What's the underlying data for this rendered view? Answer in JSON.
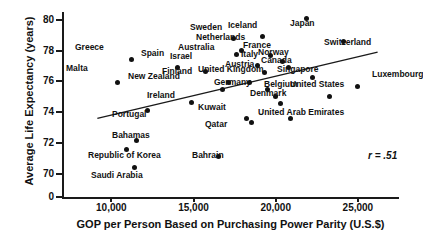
{
  "chart_data": {
    "type": "scatter",
    "title": "",
    "xlabel": "GOP per Person Based on Purchasing Power Parity (U.S.$)",
    "ylabel": "Average Life Expectancy (years)",
    "xlim": [
      7000,
      27500
    ],
    "ylim": [
      68.5,
      80.5
    ],
    "xticks": [
      "10,000",
      "15,000",
      "20,000",
      "25,000"
    ],
    "xtick_values": [
      10000,
      15000,
      20000,
      25000
    ],
    "yticks": [
      "0",
      "70",
      "72",
      "74",
      "76",
      "78",
      "80"
    ],
    "ytick_values": [
      68.5,
      70,
      72,
      74,
      76,
      78,
      80
    ],
    "grid": false,
    "legend": false,
    "annotation": "r = .51",
    "correlation": 0.51,
    "trendline": {
      "x0": 9150,
      "y0": 73.6,
      "x1": 26200,
      "y1": 77.9
    },
    "points": [
      {
        "label": "Greece",
        "x": 11250,
        "y": 77.45,
        "lx": 75,
        "ly": 43
      },
      {
        "label": "Malta",
        "x": 10400,
        "y": 75.9,
        "lx": 66,
        "ly": 64
      },
      {
        "label": "Spain",
        "x": 14000,
        "y": 76.9,
        "lx": 141,
        "ly": 49
      },
      {
        "label": "Israel",
        "x": 15750,
        "y": 76.65,
        "lx": 170,
        "ly": 52
      },
      {
        "label": "Sweden",
        "x": 17450,
        "y": 78.75,
        "lx": 190,
        "ly": 23
      },
      {
        "label": "Iceland",
        "x": 19200,
        "y": 78.9,
        "lx": 228,
        "ly": 21
      },
      {
        "label": "Japan",
        "x": 21900,
        "y": 80.05,
        "lx": 290,
        "ly": 19
      },
      {
        "label": "Switzerland",
        "x": 24100,
        "y": 78.6,
        "lx": 324,
        "ly": 38
      },
      {
        "label": "Netherlands",
        "x": 17900,
        "y": 78.0,
        "lx": 196,
        "ly": 33
      },
      {
        "label": "Australia",
        "x": 17600,
        "y": 77.75,
        "lx": 178,
        "ly": 43
      },
      {
        "label": "Italy",
        "x": 18900,
        "y": 77.0,
        "lx": 241,
        "ly": 50
      },
      {
        "label": "France",
        "x": 19700,
        "y": 77.65,
        "lx": 243,
        "ly": 41
      },
      {
        "label": "Norway",
        "x": 20400,
        "y": 77.3,
        "lx": 258,
        "ly": 48
      },
      {
        "label": "Canada",
        "x": 20800,
        "y": 76.9,
        "lx": 261,
        "ly": 56
      },
      {
        "label": "Austria",
        "x": 19300,
        "y": 76.55,
        "lx": 225,
        "ly": 60
      },
      {
        "label": "Finland",
        "x": 17100,
        "y": 75.9,
        "lx": 162,
        "ly": 67
      },
      {
        "label": "United Kingdom",
        "x": 18400,
        "y": 75.9,
        "lx": 198,
        "ly": 65
      },
      {
        "label": "Germany",
        "x": 19500,
        "y": 75.5,
        "lx": 214,
        "ly": 78
      },
      {
        "label": "Singapore",
        "x": 22250,
        "y": 76.25,
        "lx": 277,
        "ly": 65
      },
      {
        "label": "New Zealand",
        "x": 16750,
        "y": 75.5,
        "lx": 128,
        "ly": 72
      },
      {
        "label": "Belgium",
        "x": 20000,
        "y": 75.0,
        "lx": 264,
        "ly": 80
      },
      {
        "label": "Denmark",
        "x": 20300,
        "y": 74.55,
        "lx": 250,
        "ly": 89
      },
      {
        "label": "United States",
        "x": 23300,
        "y": 75.0,
        "lx": 290,
        "ly": 80
      },
      {
        "label": "Luxembourg",
        "x": 25000,
        "y": 75.65,
        "lx": 372,
        "ly": 70
      },
      {
        "label": "Ireland",
        "x": 14900,
        "y": 74.6,
        "lx": 147,
        "ly": 91
      },
      {
        "label": "Portugal",
        "x": 12200,
        "y": 74.1,
        "lx": 112,
        "ly": 110
      },
      {
        "label": "Kuwait",
        "x": 18200,
        "y": 73.6,
        "lx": 198,
        "ly": 103
      },
      {
        "label": "Qatar",
        "x": 18500,
        "y": 73.35,
        "lx": 205,
        "ly": 120
      },
      {
        "label": "United Arab Emirates",
        "x": 20900,
        "y": 73.6,
        "lx": 258,
        "ly": 108
      },
      {
        "label": "Bahamas",
        "x": 11550,
        "y": 72.15,
        "lx": 112,
        "ly": 131
      },
      {
        "label": "Republic of Korea",
        "x": 10950,
        "y": 71.6,
        "lx": 88,
        "ly": 151
      },
      {
        "label": "Bahrain",
        "x": 16550,
        "y": 71.1,
        "lx": 192,
        "ly": 151
      },
      {
        "label": "Saudi Arabia",
        "x": 11400,
        "y": 70.4,
        "lx": 91,
        "ly": 171
      }
    ]
  }
}
